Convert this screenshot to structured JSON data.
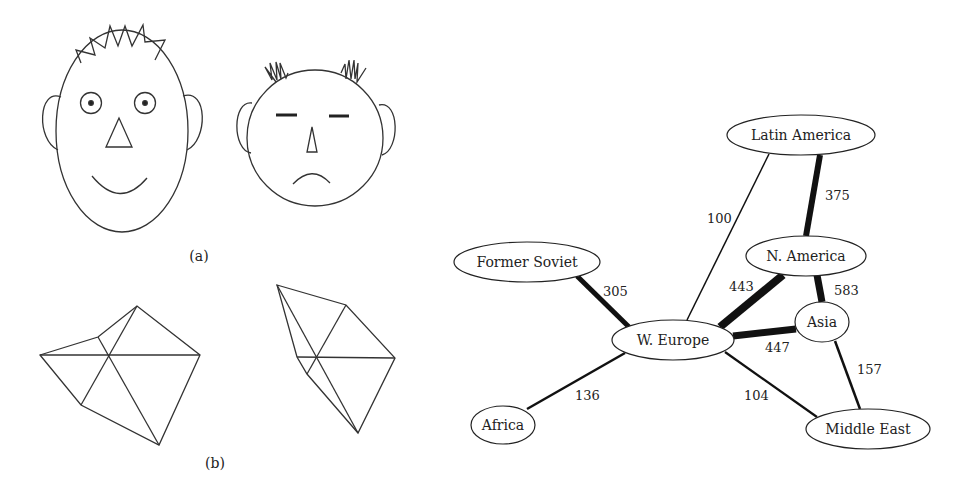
{
  "figure": {
    "panel_a": {
      "caption": "(a)"
    },
    "panel_b": {
      "caption": "(b)"
    }
  },
  "network": {
    "nodes": [
      {
        "id": "latin_america",
        "label": "Latin America",
        "cx": 801,
        "cy": 135,
        "rx": 74,
        "ry": 20
      },
      {
        "id": "n_america",
        "label": "N. America",
        "cx": 806,
        "cy": 256,
        "rx": 60,
        "ry": 20
      },
      {
        "id": "former_soviet",
        "label": "Former Soviet",
        "cx": 527,
        "cy": 262,
        "rx": 73,
        "ry": 20
      },
      {
        "id": "asia",
        "label": "Asia",
        "cx": 822,
        "cy": 322,
        "rx": 27,
        "ry": 20
      },
      {
        "id": "w_europe",
        "label": "W. Europe",
        "cx": 673,
        "cy": 340,
        "rx": 61,
        "ry": 20
      },
      {
        "id": "africa",
        "label": "Africa",
        "cx": 503,
        "cy": 425,
        "rx": 32,
        "ry": 19
      },
      {
        "id": "middle_east",
        "label": "Middle East",
        "cx": 868,
        "cy": 429,
        "rx": 62,
        "ry": 20
      }
    ],
    "edges": [
      {
        "from": "latin_america",
        "to": "n_america",
        "label": "375",
        "weight": 375
      },
      {
        "from": "latin_america",
        "to": "w_europe",
        "label": "100",
        "weight": 100
      },
      {
        "from": "former_soviet",
        "to": "w_europe",
        "label": "305",
        "weight": 305
      },
      {
        "from": "n_america",
        "to": "w_europe",
        "label": "443",
        "weight": 443
      },
      {
        "from": "n_america",
        "to": "asia",
        "label": "583",
        "weight": 583
      },
      {
        "from": "w_europe",
        "to": "asia",
        "label": "447",
        "weight": 447
      },
      {
        "from": "asia",
        "to": "middle_east",
        "label": "157",
        "weight": 157
      },
      {
        "from": "w_europe",
        "to": "middle_east",
        "label": "104",
        "weight": 104
      },
      {
        "from": "w_europe",
        "to": "africa",
        "label": "136",
        "weight": 136
      }
    ]
  }
}
